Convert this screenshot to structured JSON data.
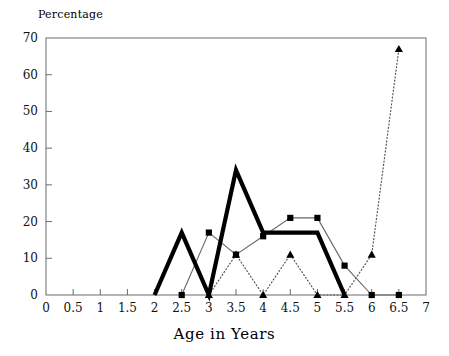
{
  "chart_data": {
    "type": "line",
    "title": "",
    "xlabel": "Age in Years",
    "ylabel": "Percentage",
    "xlim": [
      0,
      7
    ],
    "ylim": [
      0,
      70
    ],
    "xticks": [
      "0",
      "0.5",
      "1",
      "1.5",
      "2",
      "2.5",
      "3",
      "3.5",
      "4",
      "4.5",
      "5",
      "5.5",
      "6",
      "6.5",
      "7"
    ],
    "yticks": [
      "0",
      "10",
      "20",
      "30",
      "40",
      "50",
      "60",
      "70"
    ],
    "grid": false,
    "legend": "none",
    "series": [
      {
        "name": "thick-solid-line",
        "style": "thick solid, no markers",
        "marker": "none",
        "color": "#000000",
        "x": [
          2,
          2.5,
          3,
          3.5,
          4,
          4.5,
          5,
          5.5
        ],
        "values": [
          0,
          17,
          0,
          34,
          17,
          17,
          17,
          0
        ]
      },
      {
        "name": "thin-line-square-markers",
        "style": "thin solid",
        "marker": "square",
        "color": "#000000",
        "x": [
          2.5,
          3,
          3.5,
          4,
          4.5,
          5,
          5.5,
          6,
          6.5
        ],
        "values": [
          0,
          17,
          11,
          16,
          21,
          21,
          8,
          0,
          0
        ]
      },
      {
        "name": "dotted-line-triangle-markers",
        "style": "dotted",
        "marker": "triangle",
        "color": "#000000",
        "x": [
          3,
          3.5,
          4,
          4.5,
          5,
          5.5,
          6,
          6.5
        ],
        "values": [
          0,
          11,
          0,
          11,
          0,
          0,
          11,
          67
        ]
      }
    ]
  },
  "labels": {
    "y_axis_title": "Percentage",
    "x_axis_title": "Age in Years"
  }
}
